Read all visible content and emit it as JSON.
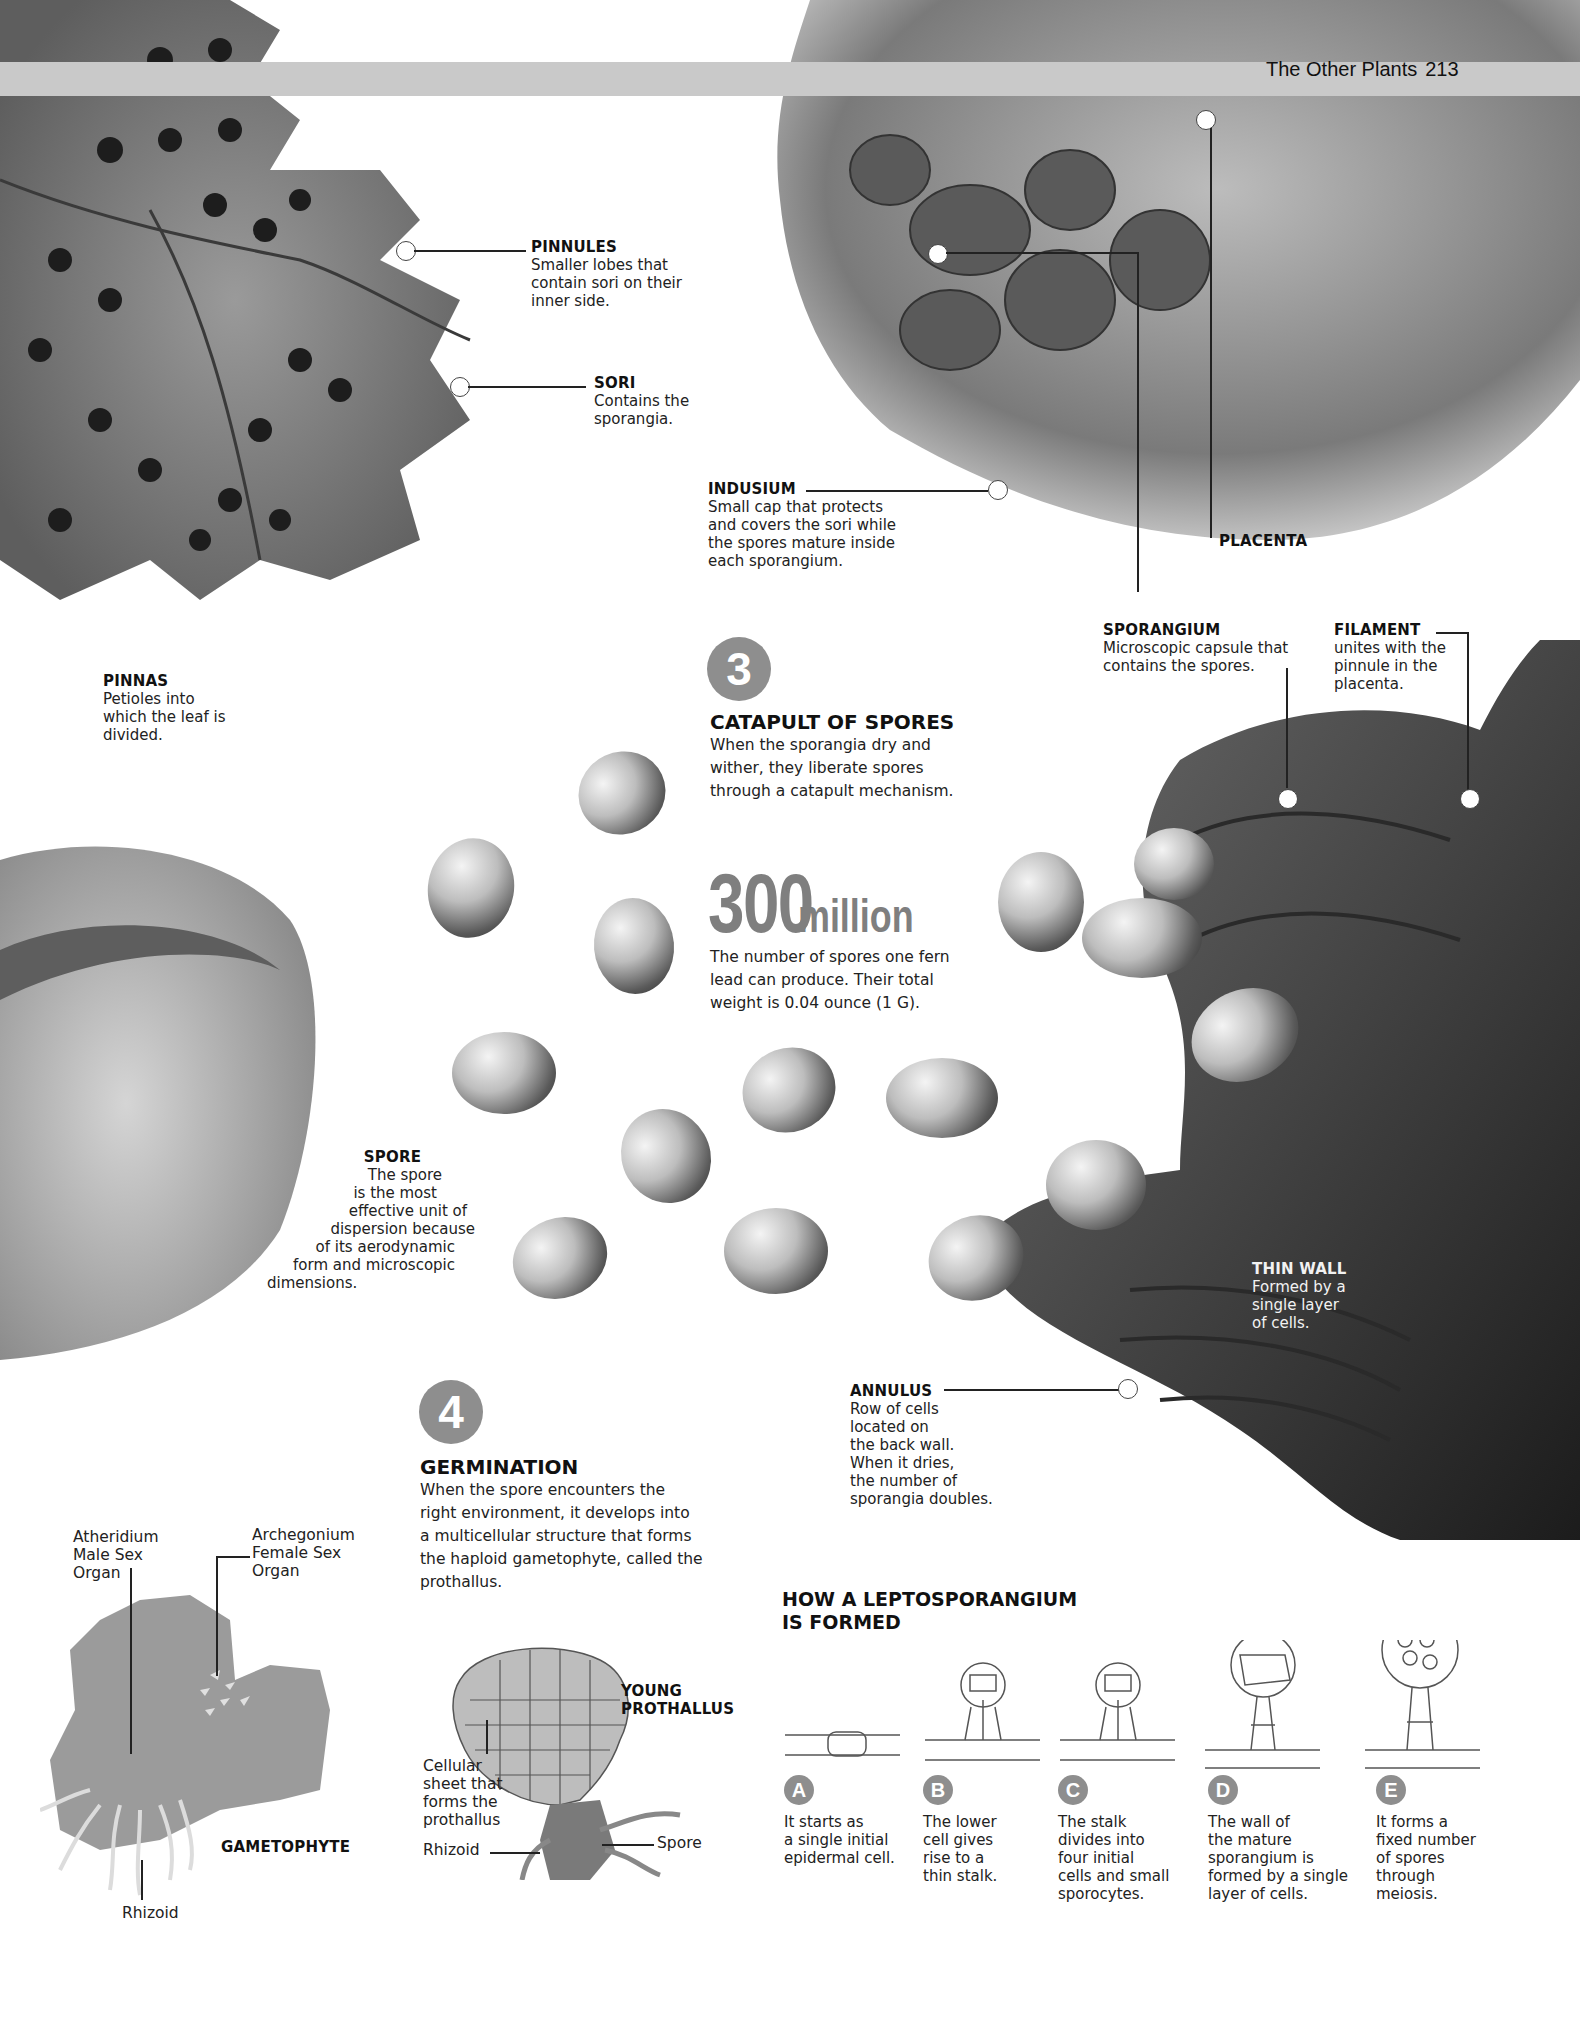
{
  "header": {
    "section_title": "The Other Plants",
    "page_number": "213"
  },
  "fern_labels": {
    "pinnules": {
      "title": "PINNULES",
      "lines": [
        "Smaller lobes that",
        "contain sori on their",
        "inner side."
      ]
    },
    "sori": {
      "title": "SORI",
      "lines": [
        "Contains the",
        "sporangia."
      ]
    },
    "pinnas": {
      "title": "PINNAS",
      "lines": [
        "Petioles into",
        "which the leaf is",
        "divided."
      ]
    },
    "indusium": {
      "title": "INDUSIUM",
      "lines": [
        "Small cap that protects",
        "and covers the sori while",
        "the spores mature inside",
        "each sporangium."
      ]
    },
    "placenta": {
      "title": "PLACENTA"
    },
    "sporangium": {
      "title": "SPORANGIUM",
      "lines": [
        "Microscopic capsule that",
        "contains the spores."
      ]
    },
    "filament": {
      "title": "FILAMENT",
      "lines": [
        "unites with the",
        "pinnule in the",
        "placenta."
      ]
    }
  },
  "section3": {
    "number": "3",
    "title": "CATAPULT OF SPORES",
    "lines": [
      "When the sporangia dry and",
      "wither, they liberate spores",
      "through a catapult mechanism."
    ]
  },
  "stat": {
    "value": "300",
    "unit": "million",
    "lines": [
      "The number of spores one fern",
      "lead can produce. Their total",
      "weight is 0.04 ounce (1 G)."
    ]
  },
  "spore_label": {
    "title": "SPORE",
    "lines": [
      "The spore",
      "is the most",
      "effective unit of",
      "dispersion because",
      "of its aerodynamic",
      "form and microscopic",
      "dimensions."
    ]
  },
  "thin_wall": {
    "title": "THIN WALL",
    "lines": [
      "Formed by a",
      "single layer",
      "of cells."
    ]
  },
  "annulus": {
    "title": "ANNULUS",
    "lines": [
      "Row of cells",
      "located on",
      "the back wall.",
      "When it dries,",
      "the number of",
      "sporangia doubles."
    ]
  },
  "section4": {
    "number": "4",
    "title": "GERMINATION",
    "lines": [
      "When the spore encounters the",
      "right environment, it develops into",
      "a multicellular structure that forms",
      "the haploid gametophyte, called the",
      "prothallus."
    ]
  },
  "gametophyte": {
    "title": "GAMETOPHYTE",
    "atheridium": [
      "Atheridium",
      "Male Sex",
      "Organ"
    ],
    "archegonium": [
      "Archegonium",
      "Female Sex",
      "Organ"
    ],
    "rhizoid": "Rhizoid"
  },
  "young_prothallus": {
    "title_lines": [
      "YOUNG",
      "PROTHALLUS"
    ],
    "cellular_sheet": [
      "Cellular",
      "sheet that",
      "forms the",
      "prothallus"
    ],
    "rhizoid": "Rhizoid",
    "spore": "Spore"
  },
  "leptosporangium": {
    "title_lines": [
      "HOW A LEPTOSPORANGIUM",
      "IS FORMED"
    ],
    "steps": [
      {
        "badge": "A",
        "lines": [
          "It starts as",
          "a single initial",
          "epidermal cell."
        ]
      },
      {
        "badge": "B",
        "lines": [
          "The lower",
          "cell gives",
          "rise to a",
          "thin stalk."
        ]
      },
      {
        "badge": "C",
        "lines": [
          "The stalk",
          "divides into",
          "four initial",
          "cells and small",
          "sporocytes."
        ]
      },
      {
        "badge": "D",
        "lines": [
          "The wall of",
          "the mature",
          "sporangium is",
          "formed by a single",
          "layer of cells."
        ]
      },
      {
        "badge": "E",
        "lines": [
          "It forms a",
          "fixed number",
          "of spores",
          "through",
          "meiosis."
        ]
      }
    ]
  },
  "colors": {
    "badge_gray": "#8e8e8e",
    "header_band": "#c9c9c9",
    "stat_gray": "#7f7f7f"
  }
}
